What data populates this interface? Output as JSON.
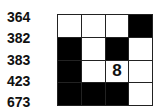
{
  "clues": [
    "364",
    "382",
    "383",
    "423",
    "673"
  ],
  "grid": {
    "rows": 4,
    "cols": 4,
    "cells": [
      [
        "",
        "",
        "",
        "#"
      ],
      [
        "#",
        "",
        "#",
        ""
      ],
      [
        "#",
        "",
        "8",
        ""
      ],
      [
        "#",
        "#",
        "#",
        ""
      ]
    ]
  }
}
